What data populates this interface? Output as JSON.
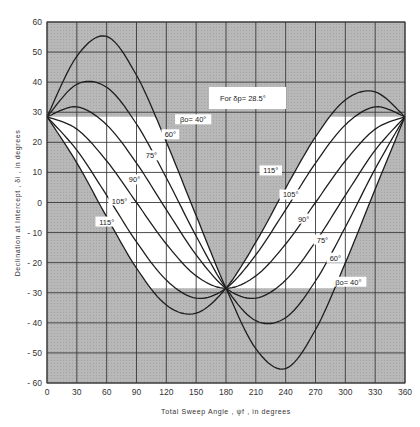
{
  "chart_data": {
    "type": "line",
    "title": "",
    "annotation": "For δp= 28.5°",
    "xlabel": "Total Sweep Angle , ψf , in degrees",
    "ylabel": "Declination at Intercept , δi , in degrees",
    "xlim": [
      0,
      360
    ],
    "ylim": [
      -60,
      60
    ],
    "xticks": [
      0,
      30,
      60,
      90,
      120,
      150,
      180,
      210,
      240,
      270,
      300,
      330,
      360
    ],
    "yticks": [
      60,
      50,
      40,
      30,
      20,
      10,
      0,
      -10,
      -20,
      -30,
      -40,
      -50,
      -60
    ],
    "grid": true,
    "band": [
      -28.5,
      28.5
    ],
    "x": [
      0,
      30,
      60,
      90,
      120,
      150,
      180,
      210,
      240,
      270,
      300,
      330,
      360
    ],
    "series": [
      {
        "name": "βo=40°",
        "values": [
          28.5,
          48.6,
          55.2,
          42.3,
          20.1,
          -4.4,
          -28.5,
          -48.6,
          -55.2,
          -42.3,
          -20.1,
          4.4,
          28.5
        ]
      },
      {
        "name": "60°",
        "values": [
          28.5,
          39.3,
          38.3,
          26.1,
          8.2,
          -11.2,
          -28.5,
          -39.3,
          -38.3,
          -26.1,
          -8.2,
          11.2,
          28.5
        ]
      },
      {
        "name": "75°",
        "values": [
          28.5,
          31.8,
          25.8,
          13.1,
          -2.4,
          -17.4,
          -28.5,
          -31.8,
          -25.8,
          -13.1,
          2.4,
          17.4,
          28.5
        ]
      },
      {
        "name": "90°",
        "values": [
          28.5,
          24.4,
          13.8,
          0,
          -13.8,
          -24.4,
          -28.5,
          -24.4,
          -13.8,
          0,
          13.8,
          24.4,
          28.5
        ]
      },
      {
        "name": "105°",
        "values": [
          28.5,
          17.4,
          2.4,
          -13.1,
          -25.8,
          -31.8,
          -28.5,
          -17.4,
          -2.4,
          13.1,
          25.8,
          31.8,
          28.5
        ]
      },
      {
        "name": "115°",
        "values": [
          28.5,
          13.2,
          -4.8,
          -21.8,
          -34.1,
          -36.8,
          -28.5,
          -13.2,
          4.8,
          21.8,
          34.1,
          36.8,
          28.5
        ]
      }
    ],
    "curve_labels_left": [
      {
        "text": "βo= 40°",
        "x": 147,
        "y": 27
      },
      {
        "text": "60°",
        "x": 124,
        "y": 22
      },
      {
        "text": "75°",
        "x": 105,
        "y": 15
      },
      {
        "text": "90°",
        "x": 88,
        "y": 7
      },
      {
        "text": "105°",
        "x": 73,
        "y": 0
      },
      {
        "text": "115°",
        "x": 60,
        "y": -7
      }
    ],
    "curve_labels_right": [
      {
        "text": "115°",
        "x": 225,
        "y": 10
      },
      {
        "text": "105°",
        "x": 245,
        "y": 2
      },
      {
        "text": "90°",
        "x": 258,
        "y": -6
      },
      {
        "text": "75°",
        "x": 277,
        "y": -13
      },
      {
        "text": "60°",
        "x": 290,
        "y": -19
      },
      {
        "text": "βo= 40°",
        "x": 303,
        "y": -27
      }
    ],
    "colors": {
      "shade": "#b4b4b4",
      "band": "#ffffff",
      "grid": "#3a3a3a",
      "curve": "#1e1e1e"
    }
  }
}
